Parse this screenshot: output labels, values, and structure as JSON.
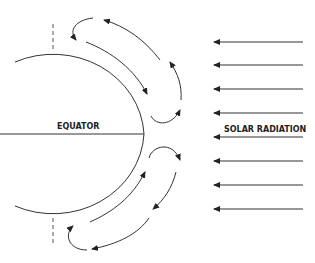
{
  "diagram": {
    "labels": {
      "equator": "EQUATOR",
      "solar_radiation": "SOLAR RADIATION"
    },
    "solar_arrow_count": 8,
    "circulation_cells": [
      {
        "name": "northern-outer-cell",
        "direction": "poleward aloft, equatorward at surface"
      },
      {
        "name": "northern-inner-cell",
        "direction": "counterclockwise loop near equator"
      },
      {
        "name": "southern-inner-cell",
        "direction": "clockwise loop near equator"
      },
      {
        "name": "southern-outer-cell",
        "direction": "poleward aloft, equatorward at surface"
      }
    ],
    "colors": {
      "line": "#333333",
      "background": "#ffffff"
    }
  }
}
